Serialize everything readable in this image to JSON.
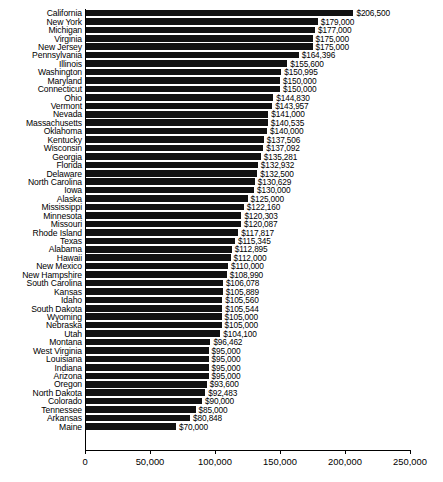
{
  "chart_data": {
    "type": "bar",
    "orientation": "horizontal",
    "title": "",
    "xlabel": "",
    "ylabel": "",
    "xlim": [
      0,
      250000
    ],
    "xticks": [
      0,
      50000,
      100000,
      150000,
      200000,
      250000
    ],
    "xtick_labels": [
      "0",
      "50,000",
      "100,000",
      "150,000",
      "200,000",
      "250,000"
    ],
    "grid": false,
    "legend": false,
    "bar_color": "#111111",
    "categories": [
      "California",
      "New York",
      "Michigan",
      "Virginia",
      "New Jersey",
      "Pennsylvania",
      "Illinois",
      "Washington",
      "Maryland",
      "Connecticut",
      "Ohio",
      "Vermont",
      "Nevada",
      "Massachusetts",
      "Oklahoma",
      "Kentucky",
      "Wisconsin",
      "Georgia",
      "Florida",
      "Delaware",
      "North Carolina",
      "Iowa",
      "Alaska",
      "Mississippi",
      "Minnesota",
      "Missouri",
      "Rhode Island",
      "Texas",
      "Alabama",
      "Hawaii",
      "New Mexico",
      "New Hampshire",
      "South Carolina",
      "Kansas",
      "Idaho",
      "South Dakota",
      "Wyoming",
      "Nebraska",
      "Utah",
      "Montana",
      "West Virginia",
      "Louisiana",
      "Indiana",
      "Arizona",
      "Oregon",
      "North Dakota",
      "Colorado",
      "Tennessee",
      "Arkansas",
      "Maine"
    ],
    "values": [
      206500,
      179000,
      177000,
      175000,
      175000,
      164396,
      155600,
      150995,
      150000,
      150000,
      144830,
      143957,
      141000,
      140535,
      140000,
      137506,
      137092,
      135281,
      132932,
      132500,
      130629,
      130000,
      125000,
      122160,
      120303,
      120087,
      117817,
      115345,
      112895,
      112000,
      110000,
      108990,
      106078,
      105889,
      105560,
      105544,
      105000,
      105000,
      104100,
      96462,
      95000,
      95000,
      95000,
      95000,
      93600,
      92483,
      90000,
      85000,
      80848,
      70000
    ],
    "value_labels": [
      "$206,500",
      "$179,000",
      "$177,000",
      "$175,000",
      "$175,000",
      "$164,396",
      "$155,600",
      "$150,995",
      "$150,000",
      "$150,000",
      "$144,830",
      "$143,957",
      "$141,000",
      "$140,535",
      "$140,000",
      "$137,506",
      "$137,092",
      "$135,281",
      "$132,932",
      "$132,500",
      "$130,629",
      "$130,000",
      "$125,000",
      "$122,160",
      "$120,303",
      "$120,087",
      "$117,817",
      "$115,345",
      "$112,895",
      "$112,000",
      "$110,000",
      "$108,990",
      "$106,078",
      "$105,889",
      "$105,560",
      "$105,544",
      "$105,000",
      "$105,000",
      "$104,100",
      "$96,462",
      "$95,000",
      "$95,000",
      "$95,000",
      "$95,000",
      "$93,600",
      "$92,483",
      "$90,000",
      "$85,000",
      "$80,848",
      "$70,000"
    ]
  }
}
